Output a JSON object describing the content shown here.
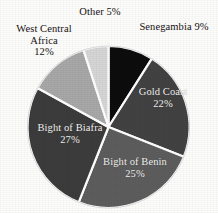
{
  "figure": {
    "title_remnant": "",
    "background_color": "#fdfdfc"
  },
  "chart_data": {
    "type": "pie",
    "title": "",
    "xlabel": "",
    "ylabel": "",
    "legend_position": "none",
    "grid": false,
    "units": "percent",
    "total": 100,
    "start_angle_deg": 0,
    "direction": "clockwise",
    "categories": [
      "Senegambia",
      "Gold Coast",
      "Bight of Benin",
      "Bight of Biafra",
      "West Central Africa",
      "Other"
    ],
    "values": [
      9,
      22,
      25,
      27,
      12,
      5
    ],
    "colors": [
      "#0d0d0d",
      "#424242",
      "#5d5d5d",
      "#3c3c3c",
      "#a8a8a8",
      "#d6d6d6"
    ],
    "slices": [
      {
        "name": "Senegambia",
        "value": 9,
        "label": "Senegambia 9%",
        "percent_text": "9%",
        "color": "#0d0d0d",
        "label_placement": "outside",
        "label_color": "#16120f"
      },
      {
        "name": "Gold Coast",
        "value": 22,
        "label": "Gold Coast\n22%",
        "percent_text": "22%",
        "color": "#424242",
        "label_placement": "inside",
        "label_color": "#f6f6f4"
      },
      {
        "name": "Bight of Benin",
        "value": 25,
        "label": "Bight of Benin\n25%",
        "percent_text": "25%",
        "color": "#5d5d5d",
        "label_placement": "inside",
        "label_color": "#f6f6f4"
      },
      {
        "name": "Bight of Biafra",
        "value": 27,
        "label": "Bight of Biafra\n27%",
        "percent_text": "27%",
        "color": "#3c3c3c",
        "label_placement": "inside",
        "label_color": "#f6f6f4"
      },
      {
        "name": "West Central Africa",
        "value": 12,
        "label": "West Central\nAfrica\n12%",
        "percent_text": "12%",
        "color": "#a8a8a8",
        "label_placement": "outside",
        "label_color": "#16120f"
      },
      {
        "name": "Other",
        "value": 5,
        "label": "Other 5%",
        "percent_text": "5%",
        "color": "#d6d6d6",
        "label_placement": "outside",
        "label_color": "#16120f"
      }
    ],
    "separator_color": "#ffffff"
  },
  "labels": {
    "senegambia": "Senegambia 9%",
    "gold_coast": "Gold Coast\n22%",
    "bight_of_benin": "Bight of Benin\n25%",
    "bight_of_biafra": "Bight of Biafra\n27%",
    "west_central_africa": "West Central\nAfrica\n12%",
    "other": "Other 5%"
  }
}
